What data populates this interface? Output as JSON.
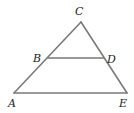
{
  "diagram": {
    "type": "geometry-figure",
    "points": {
      "A": {
        "label": "A"
      },
      "B": {
        "label": "B"
      },
      "C": {
        "label": "C"
      },
      "D": {
        "label": "D"
      },
      "E": {
        "label": "E"
      }
    },
    "segments": [
      {
        "id": "AC",
        "from": "A",
        "to": "C"
      },
      {
        "id": "CE",
        "from": "C",
        "to": "E"
      },
      {
        "id": "AE",
        "from": "A",
        "to": "E"
      },
      {
        "id": "BD",
        "from": "B",
        "to": "D"
      }
    ],
    "colors": {
      "line": "#7a7a7a",
      "label": "#222222"
    }
  }
}
